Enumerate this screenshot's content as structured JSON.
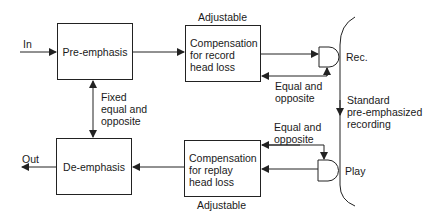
{
  "diagram": {
    "blocks": {
      "pre_emphasis": "Pre-emphasis",
      "de_emphasis": "De-emphasis",
      "record_comp": [
        "Compensation",
        "for record",
        "head loss"
      ],
      "replay_comp": [
        "Compensation",
        "for replay",
        "head loss"
      ]
    },
    "labels": {
      "input": "In",
      "output": "Out",
      "adjustable_top": "Adjustable",
      "adjustable_bottom": "Adjustable",
      "fixed": [
        "Fixed",
        "equal and",
        "opposite"
      ],
      "equal_rec": [
        "Equal and",
        "opposite"
      ],
      "equal_play": [
        "Equal and",
        "opposite"
      ],
      "rec_head": "Rec.",
      "play_head": "Play",
      "tape": [
        "Standard",
        "pre-emphasized",
        "recording"
      ]
    },
    "colors": {
      "line": "#222222",
      "background": "#ffffff"
    }
  }
}
